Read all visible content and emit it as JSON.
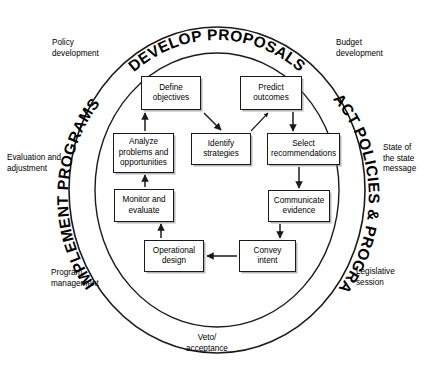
{
  "diagram": {
    "ring_labels": {
      "top": "DEVELOP PROPOSALS",
      "right": "ENACT POLICIES & PROGRAMS",
      "left": "IMPLEMENT PROGRAMS"
    },
    "outer_labels": [
      {
        "id": "policy-development",
        "text": "Policy\ndevelopment",
        "x": 52,
        "y": 38,
        "align": "left"
      },
      {
        "id": "budget-development",
        "text": "Budget\ndevelopment",
        "x": 336,
        "y": 38,
        "align": "left"
      },
      {
        "id": "evaluation-and-adjustment",
        "text": "Evaluation and\nadjustment",
        "x": 7,
        "y": 153,
        "align": "left"
      },
      {
        "id": "state-of-the-state-message",
        "text": "State of\nthe state\nmessage",
        "x": 383,
        "y": 143,
        "align": "left"
      },
      {
        "id": "program-management",
        "text": "Program\nmanagement",
        "x": 51,
        "y": 268,
        "align": "left"
      },
      {
        "id": "legislative-session",
        "text": "Legislative\nsession",
        "x": 356,
        "y": 267,
        "align": "left"
      },
      {
        "id": "veto-acceptance",
        "text": "Veto/\nacceptance",
        "x": 196,
        "y": 333,
        "align": "center"
      }
    ],
    "nodes": [
      {
        "id": "define-objectives",
        "text": "Define\nobjectives",
        "x": 141,
        "y": 76,
        "w": 60,
        "h": 34
      },
      {
        "id": "predict-outcomes",
        "text": "Predict\noutcomes",
        "x": 240,
        "y": 76,
        "w": 62,
        "h": 34
      },
      {
        "id": "analyze-problems-and-opportunities",
        "text": "Analyze\nproblems and\nopportunities",
        "x": 113,
        "y": 133,
        "w": 61,
        "h": 40
      },
      {
        "id": "identify-strategies",
        "text": "Identify\nstrategies",
        "x": 191,
        "y": 133,
        "w": 60,
        "h": 32
      },
      {
        "id": "select-recommendations",
        "text": "Select\nrecommendations",
        "x": 267,
        "y": 133,
        "w": 73,
        "h": 32
      },
      {
        "id": "communicate-evidence",
        "text": "Communicate\nevidence",
        "x": 268,
        "y": 190,
        "w": 62,
        "h": 32
      },
      {
        "id": "monitor-and-evaluate",
        "text": "Monitor and\nevaluate",
        "x": 114,
        "y": 189,
        "w": 60,
        "h": 33
      },
      {
        "id": "operational-design",
        "text": "Operational\ndesign",
        "x": 144,
        "y": 240,
        "w": 60,
        "h": 32
      },
      {
        "id": "convey-intent",
        "text": "Convey intent",
        "x": 239,
        "y": 240,
        "w": 57,
        "h": 32
      }
    ],
    "colors": {
      "stroke": "#1a1a1a",
      "background": "#ffffff",
      "text": "#000000",
      "shadow": "#787878"
    }
  }
}
